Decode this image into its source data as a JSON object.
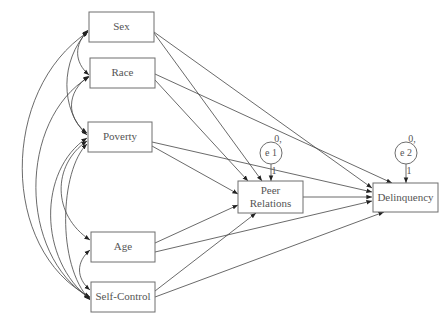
{
  "nodes": {
    "sex": {
      "label": "Sex"
    },
    "race": {
      "label": "Race"
    },
    "poverty": {
      "label": "Poverty"
    },
    "age": {
      "label": "Age"
    },
    "self_control": {
      "label": "Self-Control"
    },
    "peer_relations": {
      "label_line1": "Peer",
      "label_line2": "Relations"
    },
    "delinquency": {
      "label": "Delinquency"
    }
  },
  "errors": {
    "e1": {
      "label": "e 1",
      "mean": "0,",
      "loading": "1"
    },
    "e2": {
      "label": "e 2",
      "mean": "0,",
      "loading": "1"
    }
  },
  "paths": [
    {
      "from": "Sex",
      "to": "Peer Relations"
    },
    {
      "from": "Sex",
      "to": "Delinquency"
    },
    {
      "from": "Race",
      "to": "Peer Relations"
    },
    {
      "from": "Race",
      "to": "Delinquency"
    },
    {
      "from": "Poverty",
      "to": "Peer Relations"
    },
    {
      "from": "Poverty",
      "to": "Delinquency"
    },
    {
      "from": "Age",
      "to": "Peer Relations"
    },
    {
      "from": "Age",
      "to": "Delinquency"
    },
    {
      "from": "Self-Control",
      "to": "Peer Relations"
    },
    {
      "from": "Self-Control",
      "to": "Delinquency"
    },
    {
      "from": "Peer Relations",
      "to": "Delinquency"
    },
    {
      "from": "e 1",
      "to": "Peer Relations"
    },
    {
      "from": "e 2",
      "to": "Delinquency"
    }
  ],
  "covariances": [
    [
      "Sex",
      "Race"
    ],
    [
      "Sex",
      "Poverty"
    ],
    [
      "Sex",
      "Age"
    ],
    [
      "Sex",
      "Self-Control"
    ],
    [
      "Race",
      "Poverty"
    ],
    [
      "Race",
      "Age"
    ],
    [
      "Race",
      "Self-Control"
    ],
    [
      "Poverty",
      "Age"
    ],
    [
      "Poverty",
      "Self-Control"
    ],
    [
      "Age",
      "Self-Control"
    ]
  ]
}
